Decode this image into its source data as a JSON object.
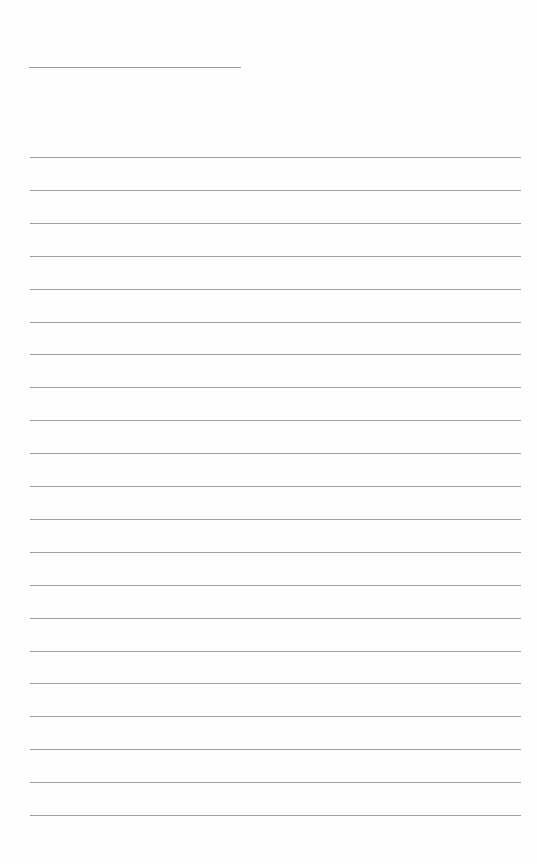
{
  "page": {
    "type": "lined writing sheet",
    "background_color": "#fefefe",
    "line_color": "#a0a0a0",
    "header_line": {
      "present": true
    },
    "ruled_lines": {
      "count": 21,
      "first_y": 157,
      "spacing": 32.9
    }
  }
}
